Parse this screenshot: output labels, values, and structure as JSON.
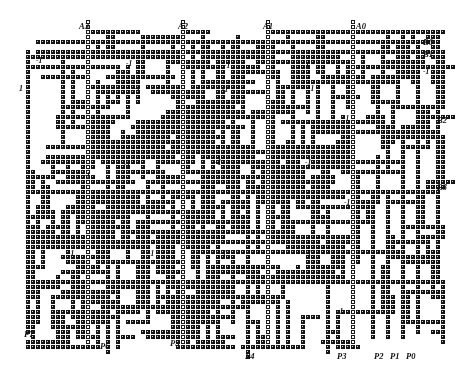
{
  "figure": {
    "kind": "routing-grid",
    "title": "",
    "width": 466,
    "height": 375,
    "background_color": "#ffffff",
    "cell_color": "#141414",
    "cell_core_color": "#d8d8d8",
    "via_ring_color": "#1a1a1a",
    "label_color": "#111111",
    "cell_pitch": 5.0,
    "cell_size": 4.2,
    "origin": {
      "x": 18.0,
      "y": 22.0
    },
    "cols": 88,
    "rows": 68
  },
  "labels": {
    "top_inputs": [
      {
        "name": "A3",
        "text": "A3",
        "x": 79,
        "y": 22
      },
      {
        "name": "A2",
        "text": "A2",
        "x": 178,
        "y": 22
      },
      {
        "name": "A1",
        "text": "A1",
        "x": 263,
        "y": 22
      },
      {
        "name": "A0",
        "text": "A0",
        "x": 356,
        "y": 22
      }
    ],
    "right_outputs": [
      {
        "name": "B0",
        "text": "B0",
        "x": 423,
        "y": 38
      },
      {
        "name": "B1",
        "text": "B1",
        "x": 423,
        "y": 50
      },
      {
        "name": "B2",
        "text": "B2",
        "x": 437,
        "y": 116
      },
      {
        "name": "B3",
        "text": "B3",
        "x": 437,
        "y": 183
      }
    ],
    "bottom_pins": [
      {
        "name": "P7",
        "text": "P7",
        "x": 24,
        "y": 330
      },
      {
        "name": "P6",
        "text": "P6",
        "x": 100,
        "y": 342
      },
      {
        "name": "P5",
        "text": "P5",
        "x": 170,
        "y": 339
      },
      {
        "name": "P4",
        "text": "P4",
        "x": 245,
        "y": 352
      },
      {
        "name": "P3",
        "text": "P3",
        "x": 337,
        "y": 352
      },
      {
        "name": "P2",
        "text": "P2",
        "x": 374,
        "y": 352
      },
      {
        "name": "P1",
        "text": "P1",
        "x": 390,
        "y": 352
      },
      {
        "name": "P0",
        "text": "P0",
        "x": 406,
        "y": 352
      }
    ],
    "left_seed": {
      "name": "seed-1",
      "text": "1",
      "x": 19,
      "y": 85
    },
    "cost_markers": [
      {
        "text": "-1",
        "x": 36,
        "y": 57
      },
      {
        "text": "-1",
        "x": 126,
        "y": 60
      },
      {
        "text": "-1",
        "x": 134,
        "y": 85
      },
      {
        "text": "-1",
        "x": 224,
        "y": 62
      },
      {
        "text": "-1",
        "x": 222,
        "y": 86
      },
      {
        "text": "-1",
        "x": 303,
        "y": 62
      },
      {
        "text": "-1",
        "x": 308,
        "y": 85
      },
      {
        "text": "-1",
        "x": 423,
        "y": 68
      },
      {
        "text": "-1",
        "x": 343,
        "y": 115
      },
      {
        "text": "-1",
        "x": 124,
        "y": 161
      },
      {
        "text": "-1",
        "x": 84,
        "y": 172
      },
      {
        "text": "-1",
        "x": 215,
        "y": 159
      },
      {
        "text": "-1",
        "x": 305,
        "y": 159
      },
      {
        "text": "-1",
        "x": 344,
        "y": 199
      },
      {
        "text": "-1",
        "x": 68,
        "y": 250
      },
      {
        "text": "-1",
        "x": 148,
        "y": 250
      },
      {
        "text": "-1",
        "x": 220,
        "y": 250
      },
      {
        "text": "-1",
        "x": 305,
        "y": 250
      },
      {
        "text": "-1",
        "x": 337,
        "y": 308
      }
    ]
  },
  "routing": {
    "comment": "Structural description of the drawn wiring. Horizontal/vertical trunks are given in grid-cell coordinates (col,row) and lengths in cells.",
    "h_trunks": [
      {
        "name": "B0-bus",
        "col": 64,
        "row": 4,
        "len": 24,
        "style": "solid"
      },
      {
        "name": "B1-bus",
        "col": 32,
        "row": 6,
        "len": 56,
        "style": "solid"
      },
      {
        "name": "row-8a",
        "col": 4,
        "row": 6,
        "len": 28,
        "style": "solid"
      },
      {
        "name": "row-12",
        "col": 4,
        "row": 9,
        "len": 12,
        "style": "solid"
      },
      {
        "name": "row-mid",
        "col": 4,
        "row": 34,
        "len": 84,
        "style": "solid"
      },
      {
        "name": "row-low",
        "col": 4,
        "row": 52,
        "len": 84,
        "style": "solid"
      },
      {
        "name": "row-26",
        "col": 22,
        "row": 26,
        "len": 40,
        "style": "solid"
      },
      {
        "name": "row-44",
        "col": 16,
        "row": 44,
        "len": 40,
        "style": "solid"
      }
    ],
    "v_trunks": [
      {
        "name": "A3-col",
        "col": 14,
        "row": 0,
        "len": 58,
        "style": "via"
      },
      {
        "name": "A2-col",
        "col": 33,
        "row": 0,
        "len": 58,
        "style": "via"
      },
      {
        "name": "A1-col",
        "col": 50,
        "row": 0,
        "len": 58,
        "style": "via"
      },
      {
        "name": "A0-col",
        "col": 67,
        "row": 0,
        "len": 58,
        "style": "via"
      },
      {
        "name": "P2-col",
        "col": 71,
        "row": 34,
        "len": 34,
        "style": "solid"
      },
      {
        "name": "P1-col",
        "col": 74,
        "row": 34,
        "len": 34,
        "style": "solid"
      },
      {
        "name": "P0-col",
        "col": 77,
        "row": 34,
        "len": 34,
        "style": "solid"
      }
    ],
    "via_symbol": "ring",
    "wire_symbol": "square"
  },
  "legend": {
    "cell": "routing cell",
    "via": "via / crossing",
    "cost": "-1"
  }
}
